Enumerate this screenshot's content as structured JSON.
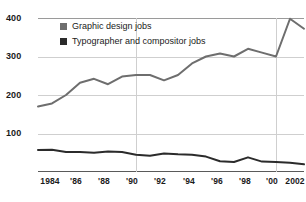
{
  "chart_data": {
    "type": "line",
    "title": "",
    "xlabel": "",
    "ylabel": "",
    "ylim": [
      0,
      400
    ],
    "yticks": [
      "100",
      "200",
      "300",
      "400"
    ],
    "ytick_values": [
      100,
      200,
      300,
      400
    ],
    "grid": "horizontal gridlines at 100,200,300,400; vertical gridlines at 1990 and 2000",
    "legend_position": "top-left inside plot",
    "x": [
      1983,
      1984,
      1985,
      1986,
      1987,
      1988,
      1989,
      1990,
      1991,
      1992,
      1993,
      1994,
      1995,
      1996,
      1997,
      1998,
      1999,
      2000,
      2001,
      2002
    ],
    "xticks": [
      "1984",
      "'86",
      "'88",
      "'90",
      "'92",
      "'94",
      "'96",
      "'98",
      "'00",
      "2002"
    ],
    "xtick_values": [
      1984,
      1986,
      1988,
      1990,
      1992,
      1994,
      1996,
      1998,
      2000,
      2002
    ],
    "xlim": [
      1983,
      2002
    ],
    "series": [
      {
        "name": "Graphic design jobs",
        "color": "#6e6e6e",
        "values": [
          170,
          178,
          200,
          232,
          242,
          228,
          248,
          252,
          252,
          238,
          252,
          282,
          300,
          308,
          300,
          320,
          310,
          300,
          398,
          372
        ]
      },
      {
        "name": "Typographer and compositor jobs",
        "color": "#2b2b2b",
        "values": [
          57,
          58,
          52,
          52,
          50,
          53,
          52,
          45,
          42,
          48,
          46,
          45,
          40,
          28,
          26,
          38,
          27,
          26,
          24,
          20
        ]
      }
    ]
  },
  "legend": {
    "items": [
      {
        "label": "Graphic design jobs",
        "color": "#6e6e6e"
      },
      {
        "label": "Typographer and compositor jobs",
        "color": "#2b2b2b"
      }
    ]
  },
  "axes": {
    "y_labels": [
      "400",
      "300",
      "200",
      "100"
    ],
    "x_labels": [
      "1984",
      "'86",
      "'88",
      "'90",
      "'92",
      "'94",
      "'96",
      "'98",
      "'00",
      "2002"
    ]
  },
  "colors": {
    "grid": "#cfcfcf",
    "axis": "#5a5a5a",
    "background": "#ffffff",
    "text": "#1a1a1a"
  }
}
